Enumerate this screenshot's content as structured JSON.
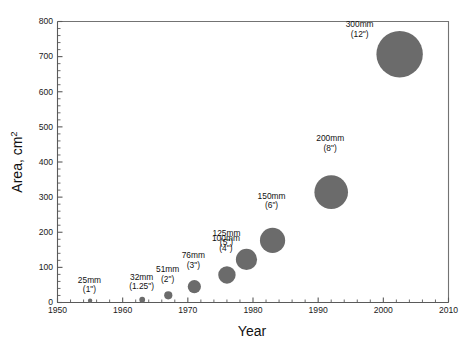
{
  "chart_data": {
    "type": "scatter",
    "title": "",
    "xlabel": "Year",
    "ylabel": "Area, cm2",
    "ylabel_text": "Area, cm",
    "ylabel_sup": "2",
    "xlim": [
      1950,
      2010
    ],
    "ylim": [
      0,
      800
    ],
    "x_major_step": 10,
    "x_minor_step": 2,
    "y_major_step": 100,
    "y_minor_step": 20,
    "grid": false,
    "legend": "none",
    "bubble_color": "#6b6b6b",
    "axis_color": "#5a5a5a",
    "background": "#ffffff",
    "x_tick_labels": [
      "1950",
      "1960",
      "1970",
      "1980",
      "1990",
      "2000",
      "2010"
    ],
    "y_tick_labels": [
      "0",
      "100",
      "200",
      "300",
      "400",
      "500",
      "600",
      "700",
      "800"
    ],
    "points": [
      {
        "label_mm": "25mm",
        "label_in": "(1\")",
        "year": 1955.0,
        "area": 4.9,
        "r_px": 2.2,
        "label_dx": -0.6,
        "label_dy": -16
      },
      {
        "label_mm": "32mm",
        "label_in": "(1.25\")",
        "year": 1963.0,
        "area": 8.0,
        "r_px": 2.9,
        "label_dx": -0.6,
        "label_dy": -17
      },
      {
        "label_mm": "51mm",
        "label_in": "(2\")",
        "year": 1967.0,
        "area": 20.4,
        "r_px": 4.1,
        "label_dx": -0.6,
        "label_dy": -19
      },
      {
        "label_mm": "76mm",
        "label_in": "(3\")",
        "year": 1971.0,
        "area": 45.4,
        "r_px": 6.6,
        "label_dx": -1.0,
        "label_dy": -22
      },
      {
        "label_mm": "100mm",
        "label_in": "(4\")",
        "year": 1976.0,
        "area": 78.5,
        "r_px": 8.7,
        "label_dx": -1.0,
        "label_dy": -25
      },
      {
        "label_mm": "125mm",
        "label_in": "(5\")",
        "year": 1979.0,
        "area": 122.7,
        "r_px": 10.6,
        "label_dx": -20.0,
        "label_dy": -13
      },
      {
        "label_mm": "150mm",
        "label_in": "(6\")",
        "year": 1983.0,
        "area": 176.7,
        "r_px": 12.6,
        "label_dx": -1.0,
        "label_dy": -29
      },
      {
        "label_mm": "200mm",
        "label_in": "(8\")",
        "year": 1992.0,
        "area": 314.2,
        "r_px": 16.8,
        "label_dx": -1.0,
        "label_dy": -34
      },
      {
        "label_mm": "300mm",
        "label_in": "(12\")",
        "year": 2002.5,
        "area": 706.9,
        "r_px": 23.2,
        "label_dx": -40.0,
        "label_dy": -4
      }
    ]
  }
}
